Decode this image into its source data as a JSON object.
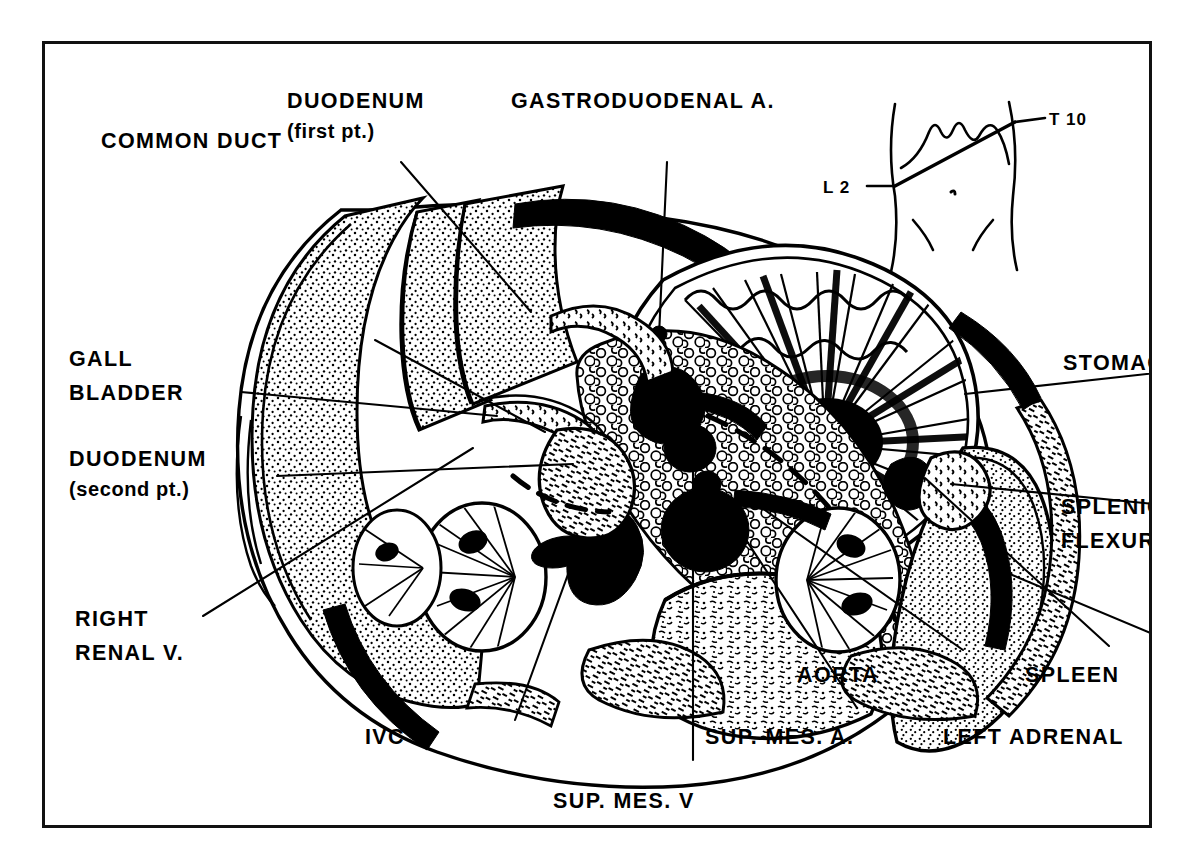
{
  "figure": {
    "kind": "anatomical-cross-section",
    "region": "upper abdomen transverse section",
    "frame_color": "#111111",
    "ink_color": "#000000",
    "background_color": "#ffffff"
  },
  "inset": {
    "name": "torso-orientation-inset",
    "upper_level_label": "T 10",
    "lower_level_label": "L 2"
  },
  "labels": [
    {
      "id": "duodenum-first",
      "line1": "DUODENUM",
      "line2": "(first pt.)"
    },
    {
      "id": "gastroduodenal",
      "line1": "GASTRODUODENAL A.",
      "line2": ""
    },
    {
      "id": "common-duct",
      "line1": "COMMON DUCT",
      "line2": ""
    },
    {
      "id": "gall-bladder",
      "line1": "GALL",
      "line2": "BLADDER"
    },
    {
      "id": "duodenum-second",
      "line1": "DUODENUM",
      "line2": "(second pt.)"
    },
    {
      "id": "right-renal-vein",
      "line1": "RIGHT",
      "line2": "RENAL V."
    },
    {
      "id": "ivc",
      "line1": "IVC",
      "line2": ""
    },
    {
      "id": "sup-mes-vein",
      "line1": "SUP. MES. V",
      "line2": ""
    },
    {
      "id": "sup-mes-artery",
      "line1": "SUP. MES. A.",
      "line2": ""
    },
    {
      "id": "aorta",
      "line1": "AORTA",
      "line2": ""
    },
    {
      "id": "left-adrenal",
      "line1": "LEFT ADRENAL",
      "line2": ""
    },
    {
      "id": "spleen",
      "line1": "SPLEEN",
      "line2": ""
    },
    {
      "id": "splenic-flexure",
      "line1": "SPLENIC",
      "line2": "FLEXURE"
    },
    {
      "id": "stomach",
      "line1": "STOMACH",
      "line2": ""
    }
  ]
}
